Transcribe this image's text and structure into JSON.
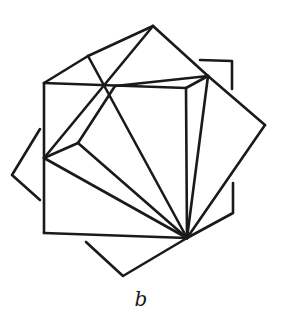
{
  "figure": {
    "caption": "b",
    "stroke_color": "#1a1a1a",
    "background": "#ffffff",
    "vertices": {
      "cube_top_left": [
        44,
        83
      ],
      "cube_top_right": [
        186,
        88
      ],
      "cube_bottom_left": [
        44,
        233
      ],
      "apex_bottom": [
        187,
        238
      ],
      "top_edge_cross": [
        115,
        86
      ],
      "rim_top_left": [
        88,
        56
      ],
      "apex_top": [
        153,
        26
      ],
      "right_cross": [
        208,
        76
      ],
      "right_tip": [
        265,
        125
      ],
      "left_inner": [
        44,
        158
      ],
      "inner_vertex": [
        78,
        143
      ],
      "left_tip": [
        12,
        175
      ]
    },
    "segments": [
      {
        "name": "cube-top-edge",
        "from": [
          44,
          83
        ],
        "to": [
          186,
          88
        ]
      },
      {
        "name": "cube-left-edge",
        "from": [
          44,
          83
        ],
        "to": [
          44,
          233
        ]
      },
      {
        "name": "cube-bottom-edge",
        "from": [
          44,
          233
        ],
        "to": [
          187,
          238
        ]
      },
      {
        "name": "cube-right-edge",
        "from": [
          186,
          88
        ],
        "to": [
          187,
          238
        ]
      },
      {
        "name": "rim-left",
        "from": [
          44,
          83
        ],
        "to": [
          88,
          56
        ]
      },
      {
        "name": "rim-top-left",
        "from": [
          88,
          56
        ],
        "to": [
          153,
          26
        ]
      },
      {
        "name": "rim-top-right",
        "from": [
          153,
          26
        ],
        "to": [
          208,
          76
        ]
      },
      {
        "name": "rim-right-top",
        "from": [
          208,
          76
        ],
        "to": [
          186,
          88
        ]
      },
      {
        "name": "top-to-cross-edge",
        "from": [
          115,
          86
        ],
        "to": [
          208,
          76
        ]
      },
      {
        "name": "diag-rim-to-bottom",
        "from": [
          88,
          56
        ],
        "to": [
          187,
          238
        ]
      },
      {
        "name": "diag-apex-to-left",
        "from": [
          153,
          26
        ],
        "to": [
          44,
          158
        ]
      },
      {
        "name": "cross-to-inner",
        "from": [
          115,
          86
        ],
        "to": [
          78,
          143
        ]
      },
      {
        "name": "inner-to-left",
        "from": [
          78,
          143
        ],
        "to": [
          44,
          158
        ]
      },
      {
        "name": "inner-to-bottom",
        "from": [
          78,
          143
        ],
        "to": [
          187,
          238
        ]
      },
      {
        "name": "left-to-bottom",
        "from": [
          44,
          158
        ],
        "to": [
          187,
          238
        ]
      },
      {
        "name": "right-cross-to-bottom",
        "from": [
          208,
          76
        ],
        "to": [
          187,
          238
        ]
      },
      {
        "name": "right-cross-to-tip",
        "from": [
          208,
          76
        ],
        "to": [
          265,
          125
        ]
      },
      {
        "name": "tip-to-bottom",
        "from": [
          265,
          125
        ],
        "to": [
          187,
          238
        ]
      }
    ],
    "brackets": [
      {
        "name": "top-right-bracket",
        "points": [
          [
            200,
            60
          ],
          [
            232,
            61
          ],
          [
            232,
            89
          ]
        ]
      },
      {
        "name": "bottom-right-bracket",
        "points": [
          [
            233,
            183
          ],
          [
            233,
            213
          ],
          [
            187,
            238
          ]
        ]
      },
      {
        "name": "bottom-bracket",
        "points": [
          [
            86,
            242
          ],
          [
            123,
            276
          ],
          [
            187,
            238
          ]
        ]
      },
      {
        "name": "left-bracket",
        "points": [
          [
            40,
            129
          ],
          [
            12,
            175
          ],
          [
            40,
            200
          ]
        ]
      }
    ]
  }
}
